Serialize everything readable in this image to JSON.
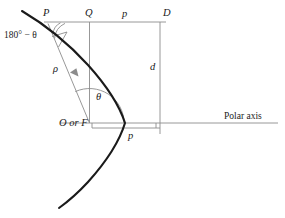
{
  "figure": {
    "kind": "polar-conic-diagram",
    "background_color": "#ffffff",
    "curve_color": "#1a1a1a",
    "line_color": "#8c8c8c",
    "text_color": "#1a1a1a"
  },
  "labels": {
    "point_p": "P",
    "point_q": "Q",
    "point_d": "D",
    "top_segment_p": "p",
    "vertical_d": "d",
    "radius_rho": "ρ",
    "angle_theta": "θ",
    "supplement_angle": "180° − θ",
    "origin_focus": "O or F",
    "bottom_segment_p": "p",
    "polar_axis": "Polar axis"
  },
  "geometry": {
    "focus": {
      "x": 89.5,
      "y": 123
    },
    "point_p": {
      "x": 47,
      "y": 22
    },
    "point_q": {
      "x": 89.5,
      "y": 22
    },
    "point_d": {
      "x": 160,
      "y": 22
    },
    "vertex": {
      "x": 125,
      "y": 123
    },
    "directrix_x": 160,
    "polar_axis_y": 123,
    "bracket_y": 130,
    "bracket_left_x": 92,
    "bracket_right_x": 160
  }
}
